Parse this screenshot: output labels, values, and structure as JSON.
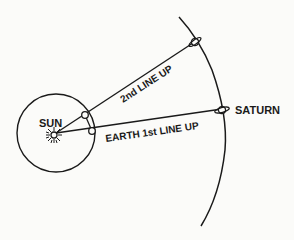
{
  "diagram": {
    "labels": {
      "sun": "SUN",
      "saturn": "SATURN",
      "first_line": "EARTH 1st LINE UP",
      "second_line": "2nd LINE UP"
    },
    "colors": {
      "background": "#fbfbf9",
      "ink": "#1a1a1a"
    },
    "elements": [
      {
        "name": "sun",
        "icon": "starburst-icon"
      },
      {
        "name": "earth-orbit",
        "shape": "circle"
      },
      {
        "name": "saturn-orbit",
        "shape": "arc"
      },
      {
        "name": "earth-position-1",
        "icon": "small-circle"
      },
      {
        "name": "earth-position-2",
        "icon": "small-circle"
      },
      {
        "name": "saturn-position-1",
        "icon": "ringed-planet-icon"
      },
      {
        "name": "saturn-position-2",
        "icon": "ringed-planet-icon"
      }
    ]
  }
}
